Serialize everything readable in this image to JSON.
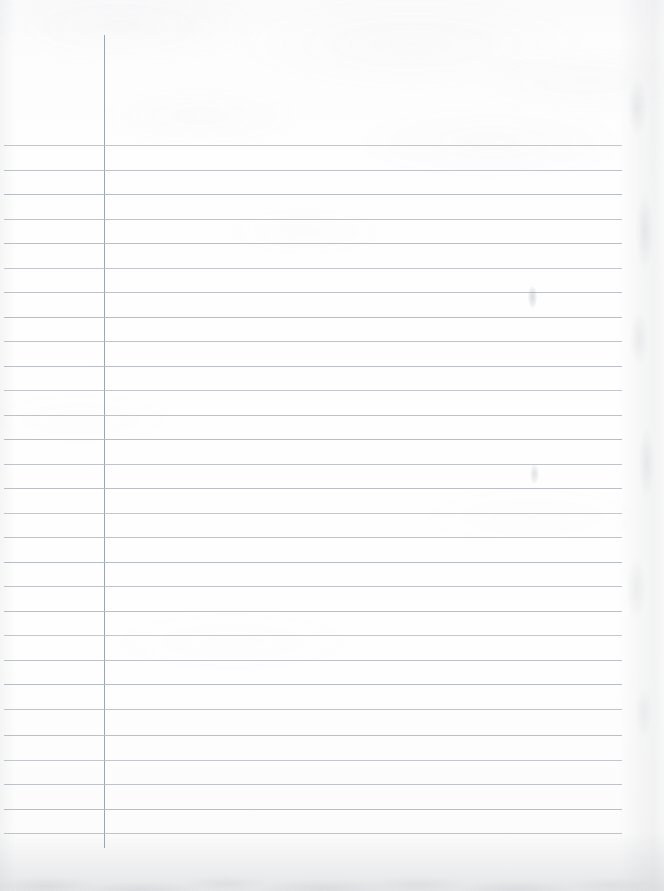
{
  "document": {
    "kind": "scanned-lined-notebook-page",
    "orientation": "portrait",
    "page_width_px": 664,
    "page_height_px": 891,
    "content_text": "",
    "has_handwriting": false,
    "blank_note": ""
  },
  "colors": {
    "paper": "#fefefe",
    "paper_top_tone": "#fafafb",
    "paper_bottom_tone": "#f6f6f7",
    "rule_line": "#b5babf",
    "margin_line": "#9aa0a8",
    "edge_shadow": "#989ca3",
    "smudge": "#96989f"
  },
  "ruling": {
    "style": "wide-ruled-single-margin",
    "rule_count": 29,
    "first_rule_y": 145,
    "rule_spacing_px": 24.5,
    "last_rule_y": 833,
    "rule_left_x": 4,
    "rule_right_x": 622,
    "rule_thickness_px": 1,
    "rule_y_positions": [
      145,
      170,
      194,
      219,
      243,
      268,
      292,
      317,
      341,
      366,
      390,
      415,
      439,
      464,
      488,
      513,
      537,
      562,
      586,
      611,
      635,
      660,
      684,
      709,
      735,
      760,
      784,
      809,
      833
    ]
  },
  "margin_rule": {
    "label": "vertical-margin-rule",
    "x": 104,
    "top_y": 35,
    "bottom_y": 848,
    "thickness_px": 1,
    "head_space_px": 110
  },
  "regions": {
    "header_area_label": "",
    "margin_column_label": "",
    "writing_area_label": ""
  },
  "artifacts": {
    "smudges": [
      {
        "name": "faint-pencil-smudge-upper",
        "x": 528,
        "y": 286,
        "width": 9,
        "height": 22
      },
      {
        "name": "faint-pencil-smudge-lower",
        "x": 530,
        "y": 464,
        "width": 9,
        "height": 20
      }
    ],
    "edges": [
      {
        "name": "bottom-scan-edge-shadow",
        "side": "bottom",
        "extent_px": 60
      },
      {
        "name": "right-scan-edge-shadow",
        "side": "right",
        "extent_px": 46
      },
      {
        "name": "left-scan-edge-shadow",
        "side": "left",
        "extent_px": 16
      }
    ]
  }
}
